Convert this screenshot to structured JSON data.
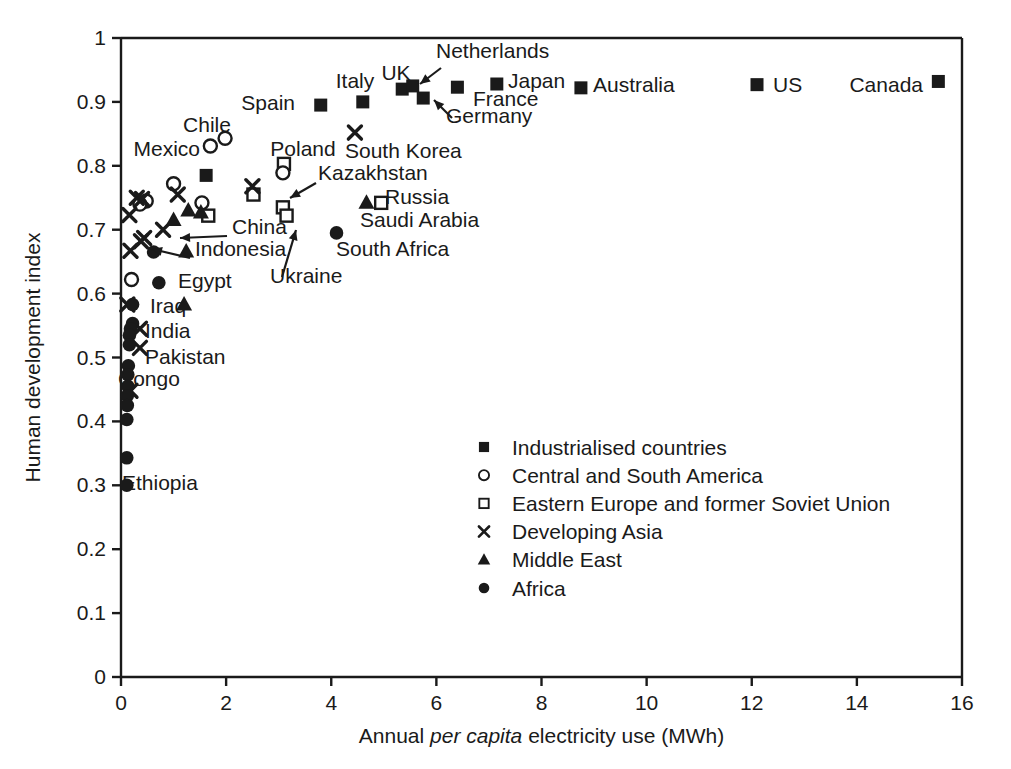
{
  "chart_data": {
    "type": "scatter",
    "title": "",
    "xlabel": "Annual per capita electricity use (MWh)",
    "xlabel_plain": "Annual ",
    "xlabel_italic": "per capita",
    "xlabel_rest": " electricity use (MWh)",
    "ylabel": "Human development index",
    "xlim": [
      0,
      16
    ],
    "ylim": [
      0,
      1
    ],
    "xticks": [
      "0",
      "2",
      "4",
      "6",
      "8",
      "10",
      "12",
      "14",
      "16"
    ],
    "xtick_values": [
      0,
      2,
      4,
      6,
      8,
      10,
      12,
      14,
      16
    ],
    "yticks": [
      "0",
      "0.1",
      "0.2",
      "0.3",
      "0.4",
      "0.5",
      "0.6",
      "0.7",
      "0.8",
      "0.9",
      "1"
    ],
    "ytick_values": [
      0,
      0.1,
      0.2,
      0.3,
      0.4,
      0.5,
      0.6,
      0.7,
      0.8,
      0.9,
      1.0
    ],
    "grid": false,
    "legend_position": "center",
    "series": [
      {
        "name": "Industrialised countries",
        "marker": "filled-square"
      },
      {
        "name": "Central and South America",
        "marker": "open-circle"
      },
      {
        "name": "Eastern Europe and former Soviet Union",
        "marker": "open-square"
      },
      {
        "name": "Developing Asia",
        "marker": "cross"
      },
      {
        "name": "Middle East",
        "marker": "filled-triangle"
      },
      {
        "name": "Africa",
        "marker": "filled-circle"
      }
    ],
    "points": [
      {
        "label": "Spain",
        "x": 3.8,
        "y": 0.895,
        "marker": "filled-square"
      },
      {
        "label": "Italy",
        "x": 4.6,
        "y": 0.9,
        "marker": "filled-square"
      },
      {
        "label": "UK",
        "x": 5.35,
        "y": 0.92,
        "marker": "filled-square"
      },
      {
        "label": "Netherlands",
        "x": 5.55,
        "y": 0.925,
        "marker": "filled-square"
      },
      {
        "label": "Germany",
        "x": 5.75,
        "y": 0.906,
        "marker": "filled-square"
      },
      {
        "label": "France",
        "x": 6.4,
        "y": 0.923,
        "marker": "filled-square"
      },
      {
        "label": "Japan",
        "x": 7.15,
        "y": 0.928,
        "marker": "filled-square"
      },
      {
        "label": "Australia",
        "x": 8.75,
        "y": 0.922,
        "marker": "filled-square"
      },
      {
        "label": "US",
        "x": 12.1,
        "y": 0.927,
        "marker": "filled-square"
      },
      {
        "label": "Canada",
        "x": 15.55,
        "y": 0.932,
        "marker": "filled-square"
      },
      {
        "label": "",
        "x": 1.62,
        "y": 0.785,
        "marker": "filled-square"
      },
      {
        "label": "Chile",
        "x": 1.98,
        "y": 0.843,
        "marker": "open-circle"
      },
      {
        "label": "Mexico",
        "x": 1.7,
        "y": 0.831,
        "marker": "open-circle"
      },
      {
        "label": "",
        "x": 1.0,
        "y": 0.772,
        "marker": "open-circle"
      },
      {
        "label": "",
        "x": 0.48,
        "y": 0.745,
        "marker": "open-circle"
      },
      {
        "label": "",
        "x": 0.36,
        "y": 0.74,
        "marker": "open-circle"
      },
      {
        "label": "",
        "x": 1.54,
        "y": 0.742,
        "marker": "open-circle"
      },
      {
        "label": "",
        "x": 0.2,
        "y": 0.622,
        "marker": "open-circle"
      },
      {
        "label": "Poland",
        "x": 3.1,
        "y": 0.803,
        "marker": "open-square"
      },
      {
        "label": "",
        "x": 3.08,
        "y": 0.789,
        "marker": "open-circle"
      },
      {
        "label": "",
        "x": 2.52,
        "y": 0.755,
        "marker": "open-square"
      },
      {
        "label": "Kazakhstan",
        "x": 3.08,
        "y": 0.735,
        "marker": "open-square"
      },
      {
        "label": "Ukraine",
        "x": 3.15,
        "y": 0.722,
        "marker": "open-square"
      },
      {
        "label": "Russia",
        "x": 4.95,
        "y": 0.742,
        "marker": "open-square"
      },
      {
        "label": "",
        "x": 1.66,
        "y": 0.722,
        "marker": "open-square"
      },
      {
        "label": "South Korea",
        "x": 4.45,
        "y": 0.852,
        "marker": "cross"
      },
      {
        "label": "",
        "x": 2.5,
        "y": 0.768,
        "marker": "cross"
      },
      {
        "label": "",
        "x": 1.08,
        "y": 0.755,
        "marker": "cross"
      },
      {
        "label": "",
        "x": 0.3,
        "y": 0.75,
        "marker": "cross"
      },
      {
        "label": "",
        "x": 0.4,
        "y": 0.748,
        "marker": "cross"
      },
      {
        "label": "",
        "x": 0.16,
        "y": 0.723,
        "marker": "cross"
      },
      {
        "label": "China",
        "x": 0.8,
        "y": 0.7,
        "marker": "cross"
      },
      {
        "label": "Indonesia",
        "x": 0.44,
        "y": 0.687,
        "marker": "cross"
      },
      {
        "label": "",
        "x": 0.38,
        "y": 0.682,
        "marker": "cross"
      },
      {
        "label": "",
        "x": 0.18,
        "y": 0.667,
        "marker": "cross"
      },
      {
        "label": "",
        "x": 0.12,
        "y": 0.583,
        "marker": "cross"
      },
      {
        "label": "India",
        "x": 0.36,
        "y": 0.545,
        "marker": "cross"
      },
      {
        "label": "Pakistan",
        "x": 0.36,
        "y": 0.515,
        "marker": "cross"
      },
      {
        "label": "",
        "x": 0.18,
        "y": 0.448,
        "marker": "cross"
      },
      {
        "label": "Saudi Arabia",
        "x": 4.67,
        "y": 0.742,
        "marker": "filled-triangle"
      },
      {
        "label": "",
        "x": 1.28,
        "y": 0.73,
        "marker": "filled-triangle"
      },
      {
        "label": "",
        "x": 1.0,
        "y": 0.715,
        "marker": "filled-triangle"
      },
      {
        "label": "",
        "x": 1.52,
        "y": 0.727,
        "marker": "filled-triangle"
      },
      {
        "label": "",
        "x": 1.24,
        "y": 0.666,
        "marker": "filled-triangle"
      },
      {
        "label": "Iraq",
        "x": 1.2,
        "y": 0.583,
        "marker": "filled-triangle"
      },
      {
        "label": "South Africa",
        "x": 4.1,
        "y": 0.695,
        "marker": "filled-circle"
      },
      {
        "label": "",
        "x": 0.62,
        "y": 0.665,
        "marker": "filled-circle"
      },
      {
        "label": "Egypt",
        "x": 0.72,
        "y": 0.617,
        "marker": "filled-circle"
      },
      {
        "label": "",
        "x": 0.22,
        "y": 0.583,
        "marker": "filled-circle"
      },
      {
        "label": "",
        "x": 0.22,
        "y": 0.553,
        "marker": "filled-circle"
      },
      {
        "label": "",
        "x": 0.18,
        "y": 0.545,
        "marker": "filled-circle"
      },
      {
        "label": "",
        "x": 0.16,
        "y": 0.535,
        "marker": "filled-circle"
      },
      {
        "label": "",
        "x": 0.16,
        "y": 0.52,
        "marker": "filled-circle"
      },
      {
        "label": "Congo",
        "x": 0.14,
        "y": 0.487,
        "marker": "filled-circle"
      },
      {
        "label": "",
        "x": 0.13,
        "y": 0.473,
        "marker": "filled-circle"
      },
      {
        "label": "",
        "x": 0.13,
        "y": 0.455,
        "marker": "filled-circle"
      },
      {
        "label": "",
        "x": 0.12,
        "y": 0.44,
        "marker": "filled-circle"
      },
      {
        "label": "",
        "x": 0.12,
        "y": 0.425,
        "marker": "filled-circle"
      },
      {
        "label": "",
        "x": 0.11,
        "y": 0.403,
        "marker": "filled-circle"
      },
      {
        "label": "",
        "x": 0.11,
        "y": 0.343,
        "marker": "filled-circle"
      },
      {
        "label": "Ethiopia",
        "x": 0.11,
        "y": 0.3,
        "marker": "filled-circle"
      }
    ],
    "annotations": [
      {
        "text": "Spain",
        "x": 295,
        "y": 110,
        "anchor": "end"
      },
      {
        "text": "Italy",
        "x": 355,
        "y": 88,
        "anchor": "middle"
      },
      {
        "text": "UK",
        "x": 396,
        "y": 80,
        "anchor": "middle"
      },
      {
        "text": "Netherlands",
        "x": 436,
        "y": 58,
        "anchor": "start"
      },
      {
        "text": "Germany",
        "x": 446,
        "y": 123,
        "anchor": "start"
      },
      {
        "text": "France",
        "x": 473,
        "y": 106,
        "anchor": "start"
      },
      {
        "text": "Japan",
        "x": 508,
        "y": 88,
        "anchor": "start"
      },
      {
        "text": "Australia",
        "x": 593,
        "y": 92,
        "anchor": "start"
      },
      {
        "text": "US",
        "x": 773,
        "y": 92,
        "anchor": "start"
      },
      {
        "text": "Canada",
        "x": 923,
        "y": 92,
        "anchor": "end"
      },
      {
        "text": "Chile",
        "x": 207,
        "y": 132,
        "anchor": "middle"
      },
      {
        "text": "Mexico",
        "x": 200,
        "y": 156,
        "anchor": "end"
      },
      {
        "text": "Poland",
        "x": 303,
        "y": 156,
        "anchor": "middle"
      },
      {
        "text": "South Korea",
        "x": 345,
        "y": 158,
        "anchor": "start"
      },
      {
        "text": "Kazakhstan",
        "x": 318,
        "y": 180,
        "anchor": "start"
      },
      {
        "text": "Russia",
        "x": 385,
        "y": 204,
        "anchor": "start"
      },
      {
        "text": "Saudi Arabia",
        "x": 360,
        "y": 227,
        "anchor": "start"
      },
      {
        "text": "China",
        "x": 232,
        "y": 234,
        "anchor": "start"
      },
      {
        "text": "Indonesia",
        "x": 195,
        "y": 256,
        "anchor": "start"
      },
      {
        "text": "South Africa",
        "x": 336,
        "y": 256,
        "anchor": "start"
      },
      {
        "text": "Ukraine",
        "x": 270,
        "y": 283,
        "anchor": "start"
      },
      {
        "text": "Egypt",
        "x": 178,
        "y": 288,
        "anchor": "start"
      },
      {
        "text": "Iraq",
        "x": 150,
        "y": 313,
        "anchor": "start"
      },
      {
        "text": "India",
        "x": 145,
        "y": 338,
        "anchor": "start"
      },
      {
        "text": "Pakistan",
        "x": 145,
        "y": 364,
        "anchor": "start"
      },
      {
        "text": "Congo",
        "x": 118,
        "y": 386,
        "anchor": "start"
      },
      {
        "text": "Ethiopia",
        "x": 122,
        "y": 490,
        "anchor": "start"
      }
    ]
  },
  "legend": {
    "items": [
      {
        "marker": "filled-square",
        "label": "Industrialised countries"
      },
      {
        "marker": "open-circle",
        "label": "Central and South America"
      },
      {
        "marker": "open-square",
        "label": "Eastern Europe and former Soviet Union"
      },
      {
        "marker": "cross",
        "label": "Developing Asia"
      },
      {
        "marker": "filled-triangle",
        "label": "Middle East"
      },
      {
        "marker": "filled-circle",
        "label": "Africa"
      }
    ]
  },
  "colors": {
    "ink": "#1a1a1a",
    "background": "#ffffff"
  }
}
